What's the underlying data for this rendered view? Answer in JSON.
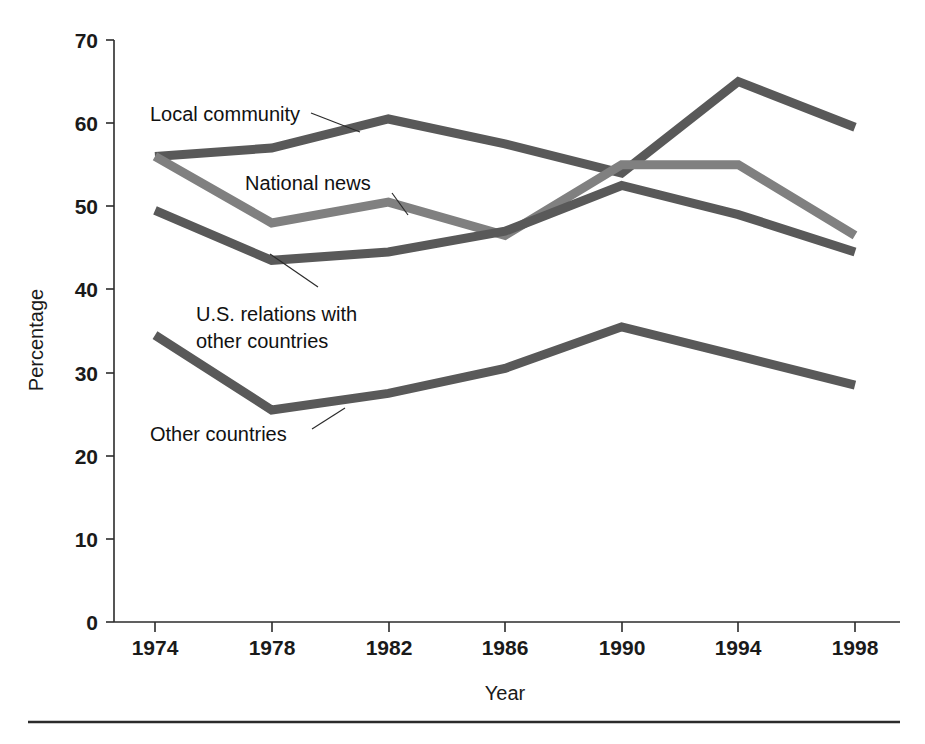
{
  "chart_data": {
    "type": "line",
    "title": "",
    "xlabel": "Year",
    "ylabel": "Percentage",
    "categories": [
      "1974",
      "1978",
      "1982",
      "1986",
      "1990",
      "1994",
      "1998"
    ],
    "x": [
      1974,
      1978,
      1982,
      1986,
      1990,
      1994,
      1998
    ],
    "xlim": [
      1974,
      1998
    ],
    "ylim": [
      0,
      70
    ],
    "ytick_labels": [
      "0",
      "10",
      "20",
      "30",
      "40",
      "50",
      "60",
      "70"
    ],
    "yticks": [
      0,
      10,
      20,
      30,
      40,
      50,
      60,
      70
    ],
    "xtick_labels": [
      "1974",
      "1978",
      "1982",
      "1986",
      "1990",
      "1994",
      "1998"
    ],
    "grid": false,
    "legend_position": "inline-annotations",
    "series": [
      {
        "name": "Local community",
        "color": "#595959",
        "values": [
          56.0,
          57.0,
          60.5,
          57.5,
          54.0,
          65.0,
          59.5
        ]
      },
      {
        "name": "National news",
        "color": "#808080",
        "values": [
          56.0,
          48.0,
          50.5,
          46.5,
          55.0,
          55.0,
          46.5
        ]
      },
      {
        "name": "U.S. relations with other countries",
        "color": "#595959",
        "values": [
          49.5,
          43.5,
          44.5,
          47.0,
          52.5,
          49.0,
          44.5
        ]
      },
      {
        "name": "Other countries",
        "color": "#595959",
        "values": [
          34.5,
          25.5,
          27.5,
          30.5,
          35.5,
          32.0,
          28.5
        ]
      }
    ],
    "annotations": [
      {
        "text": "Local community",
        "for_series": "Local community"
      },
      {
        "text": "National news",
        "for_series": "National news"
      },
      {
        "text": "U.S. relations with",
        "for_series": "U.S. relations with other countries"
      },
      {
        "text": "other countries",
        "for_series": "U.S. relations with other countries"
      },
      {
        "text": "Other countries",
        "for_series": "Other countries"
      }
    ]
  },
  "axes": {
    "y_title": "Percentage",
    "x_title": "Year",
    "y_ticks": [
      "70",
      "60",
      "50",
      "40",
      "30",
      "20",
      "10",
      "0"
    ],
    "x_ticks": [
      "1974",
      "1978",
      "1982",
      "1986",
      "1990",
      "1994",
      "1998"
    ]
  },
  "labels": {
    "local_community": "Local community",
    "national_news": "National news",
    "us_relations_line1": "U.S. relations with",
    "us_relations_line2": "other countries",
    "other_countries": "Other countries"
  },
  "colors": {
    "ink": "#1a1a1a",
    "axis": "#2b2b2b",
    "series_dark": "#595959",
    "series_light": "#808080",
    "background": "#ffffff"
  }
}
